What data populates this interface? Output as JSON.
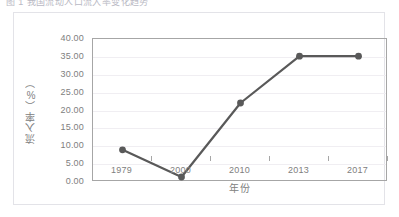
{
  "top_strip": {
    "clipped_text": "图 1 我国流动人口流入率变化趋势"
  },
  "chart_data": {
    "type": "line",
    "title": "",
    "xlabel": "年份",
    "ylabel": "流入率（%）",
    "categories": [
      "1979",
      "2000",
      "2010",
      "2013",
      "2017"
    ],
    "values": [
      9.0,
      1.4,
      22.1,
      35.2,
      35.2
    ],
    "series": [
      {
        "name": "流入率",
        "values": [
          9.0,
          1.4,
          22.1,
          35.2,
          35.2
        ]
      }
    ],
    "ylim": [
      0,
      40
    ],
    "ytick_step": 5,
    "ytick_labels": [
      "40.00",
      "35.00",
      "30.00",
      "25.00",
      "20.00",
      "15.00",
      "10.00",
      "5.00",
      "0.00"
    ],
    "ytick_values": [
      40,
      35,
      30,
      25,
      20,
      15,
      10,
      5,
      0
    ],
    "grid": true,
    "legend": "none",
    "marker": "circle",
    "colors": {
      "line": "#595959",
      "marker": "#595959",
      "grid": "#f0eef2",
      "axis": "#a6a6a6",
      "text": "#808080",
      "frame": "#e3e3e8"
    }
  }
}
